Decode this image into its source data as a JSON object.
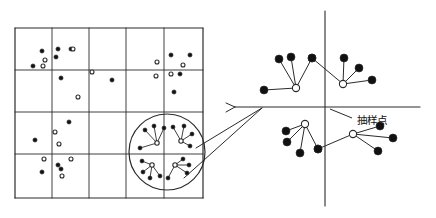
{
  "figure": {
    "background": "#ffffff",
    "stroke_color": "#2b2b2b",
    "dot_fill_color": "#111111",
    "dot_hollow_fill": "#ffffff",
    "width": 436,
    "height": 218
  },
  "labels": {
    "sampling_point": "抽样点"
  },
  "grid": {
    "x0": 15,
    "y0": 28,
    "x1": 203,
    "y1": 198,
    "cols": 5,
    "rows": 4,
    "col_lines": [
      15,
      52,
      89,
      126,
      164,
      203
    ],
    "row_lines": [
      28,
      70,
      112,
      154,
      198
    ]
  },
  "grid_points": {
    "filled": [
      [
        42,
        51
      ],
      [
        56,
        57
      ],
      [
        58,
        49
      ],
      [
        71,
        49
      ],
      [
        33,
        66
      ],
      [
        61,
        78
      ],
      [
        112,
        80
      ],
      [
        171,
        55
      ],
      [
        190,
        55
      ],
      [
        180,
        74
      ],
      [
        174,
        92
      ],
      [
        69,
        122
      ],
      [
        35,
        140
      ],
      [
        58,
        165
      ],
      [
        42,
        172
      ],
      [
        61,
        169
      ]
    ],
    "hollow": [
      [
        73,
        49
      ],
      [
        45,
        60
      ],
      [
        43,
        66
      ],
      [
        92,
        72
      ],
      [
        78,
        97
      ],
      [
        157,
        62
      ],
      [
        183,
        65
      ],
      [
        156,
        76
      ],
      [
        171,
        74
      ],
      [
        55,
        132
      ],
      [
        59,
        144
      ],
      [
        44,
        159
      ],
      [
        71,
        159
      ],
      [
        62,
        176
      ]
    ]
  },
  "magnifier_circle": {
    "cx": 167,
    "cy": 152,
    "r": 38
  },
  "magnifier_clusters": [
    {
      "center": [
        157,
        143
      ],
      "satellites": [
        [
          145,
          130
        ],
        [
          154,
          126
        ],
        [
          164,
          128
        ],
        [
          140,
          148
        ]
      ]
    },
    {
      "center": [
        181,
        141
      ],
      "satellites": [
        [
          173,
          127
        ],
        [
          184,
          126
        ],
        [
          192,
          134
        ],
        [
          190,
          146
        ]
      ]
    },
    {
      "center": [
        152,
        165
      ],
      "satellites": [
        [
          142,
          161
        ],
        [
          143,
          172
        ],
        [
          150,
          178
        ],
        [
          160,
          176
        ]
      ]
    },
    {
      "center": [
        175,
        165
      ],
      "satellites": [
        [
          183,
          159
        ],
        [
          189,
          165
        ],
        [
          187,
          173
        ],
        [
          168,
          178
        ]
      ]
    }
  ],
  "callout_arrow": {
    "from_a": [
      196,
      148
    ],
    "from_b": [
      184,
      178
    ],
    "tip": [
      262,
      108
    ]
  },
  "axes": {
    "x_axis": {
      "x1": 235,
      "y1": 107,
      "x2": 420,
      "y2": 107
    },
    "y_axis": {
      "x1": 325,
      "y1": 11,
      "x2": 325,
      "y2": 206
    },
    "origin": [
      325,
      107
    ]
  },
  "axis_clusters": [
    {
      "name": "cluster-upper-left",
      "center": [
        296,
        88
      ],
      "satellites": [
        [
          279,
          59
        ],
        [
          291,
          57
        ],
        [
          312,
          58
        ],
        [
          264,
          90
        ]
      ]
    },
    {
      "name": "cluster-upper-right",
      "center": [
        343,
        84
      ],
      "satellites": [
        [
          344,
          58
        ],
        [
          359,
          68
        ],
        [
          372,
          80
        ],
        [
          312,
          58
        ]
      ]
    },
    {
      "name": "cluster-lower-left",
      "center": [
        305,
        124
      ],
      "satellites": [
        [
          286,
          131
        ],
        [
          287,
          142
        ],
        [
          300,
          153
        ],
        [
          318,
          149
        ]
      ]
    },
    {
      "name": "cluster-lower-right",
      "center": [
        353,
        134
      ],
      "satellites": [
        [
          380,
          126
        ],
        [
          393,
          138
        ],
        [
          378,
          151
        ],
        [
          318,
          149
        ]
      ]
    }
  ],
  "label_positions": {
    "sampling_point": [
      357,
      124
    ],
    "leader_from": [
      352,
      118
    ],
    "leader_to": [
      330,
      109
    ]
  }
}
